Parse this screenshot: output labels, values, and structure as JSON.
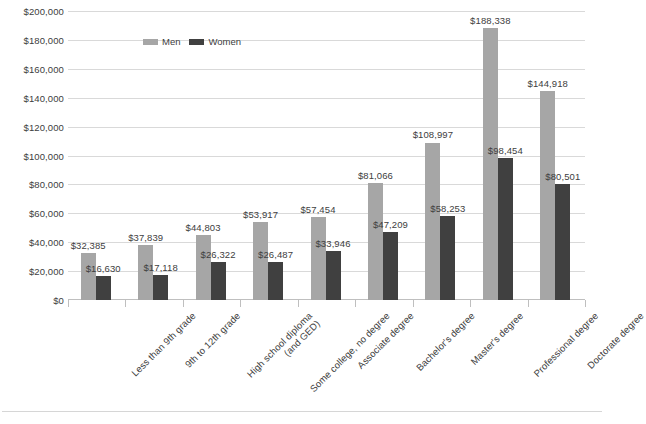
{
  "chart_data": {
    "type": "bar",
    "title": "",
    "xlabel": "",
    "ylabel": "",
    "ylim": [
      0,
      200000
    ],
    "ytick_step": 20000,
    "grid": true,
    "legend_position": "top-center-inside",
    "categories": [
      "Less than 9th grade",
      "9th to 12th grade",
      "High school diploma (and GED)",
      "Some college, no degree",
      "Associate degree",
      "Bachelor's degree",
      "Master's degree",
      "Professional degree",
      "Doctorate degree"
    ],
    "series": [
      {
        "name": "Men",
        "color": "#a6a6a6",
        "values": [
          32385,
          37839,
          44803,
          53917,
          57454,
          81066,
          108997,
          188338,
          144918
        ],
        "labels": [
          "$32,385",
          "$37,839",
          "$44,803",
          "$53,917",
          "$57,454",
          "$81,066",
          "$108,997",
          "$188,338",
          "$144,918"
        ]
      },
      {
        "name": "Women",
        "color": "#404040",
        "values": [
          16630,
          17118,
          26322,
          26487,
          33946,
          47209,
          58253,
          98454,
          80501
        ],
        "labels": [
          "$16,630",
          "$17,118",
          "$26,322",
          "$26,487",
          "$33,946",
          "$47,209",
          "$58,253",
          "$98,454",
          "$80,501"
        ]
      }
    ]
  },
  "axis": {
    "y_ticks": [
      "$200,000",
      "$180,000",
      "$160,000",
      "$140,000",
      "$120,000",
      "$100,000",
      "$80,000",
      "$60,000",
      "$40,000",
      "$20,000",
      "$0"
    ],
    "x_labels": [
      {
        "line1": "Less than 9th grade",
        "line2": ""
      },
      {
        "line1": "9th to 12th grade",
        "line2": ""
      },
      {
        "line1": "High school diploma",
        "line2": "(and GED)"
      },
      {
        "line1": "Some college, no degree",
        "line2": ""
      },
      {
        "line1": "Associate degree",
        "line2": ""
      },
      {
        "line1": "Bachelor's degree",
        "line2": ""
      },
      {
        "line1": "Master's degree",
        "line2": ""
      },
      {
        "line1": "Professional degree",
        "line2": ""
      },
      {
        "line1": "Doctorate degree",
        "line2": ""
      }
    ]
  },
  "legend": {
    "items": [
      {
        "label": "Men",
        "color": "#a6a6a6"
      },
      {
        "label": "Women",
        "color": "#404040"
      }
    ]
  }
}
